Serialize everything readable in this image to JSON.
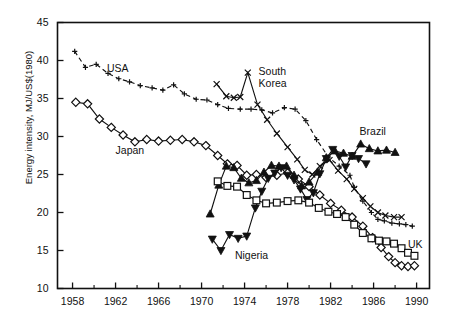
{
  "chart_data": {
    "type": "line",
    "title": "",
    "xlabel": "",
    "ylabel": "Energy intensity, MJ/US$(1980)",
    "xlim": [
      1956.6,
      1991.2
    ],
    "ylim": [
      10,
      45
    ],
    "xticks": [
      1958,
      1962,
      1966,
      1970,
      1974,
      1978,
      1982,
      1986,
      1990
    ],
    "yticks": [
      10,
      15,
      20,
      25,
      30,
      35,
      40,
      45
    ],
    "xtick_labels": [
      "1958",
      "1962",
      "1966",
      "1970",
      "1974",
      "1978",
      "1982",
      "1986",
      "1990"
    ],
    "ytick_labels": [
      "10",
      "15",
      "20",
      "25",
      "30",
      "35",
      "40",
      "45"
    ],
    "xtick_minor_step": 2,
    "grid": false,
    "legend": "inline-annotations",
    "series": [
      {
        "name": "USA",
        "marker": "plus",
        "line": "dashed",
        "color": "#111111",
        "points": [
          [
            1958.2,
            41.2
          ],
          [
            1959.2,
            39.1
          ],
          [
            1960.2,
            39.5
          ],
          [
            1961.3,
            38.3
          ],
          [
            1962.3,
            37.6
          ],
          [
            1963.3,
            37.2
          ],
          [
            1964.3,
            36.7
          ],
          [
            1965.4,
            36.4
          ],
          [
            1966.4,
            36.1
          ],
          [
            1967.4,
            36.8
          ],
          [
            1968.4,
            35.6
          ],
          [
            1969.5,
            34.9
          ],
          [
            1970.5,
            34.8
          ],
          [
            1971.5,
            34.2
          ],
          [
            1972.5,
            33.7
          ],
          [
            1973.6,
            33.6
          ],
          [
            1974.6,
            33.6
          ],
          [
            1975.6,
            33.5
          ],
          [
            1976.6,
            33.1
          ],
          [
            1977.7,
            33.8
          ],
          [
            1978.7,
            33.6
          ],
          [
            1979.7,
            32.1
          ],
          [
            1980.7,
            29.6
          ],
          [
            1981.8,
            27.3
          ],
          [
            1982.8,
            26.1
          ],
          [
            1983.8,
            24.9
          ],
          [
            1984.2,
            23.3
          ],
          [
            1985.0,
            21.5
          ],
          [
            1985.8,
            20.0
          ],
          [
            1986.4,
            19.1
          ],
          [
            1987.0,
            18.9
          ],
          [
            1987.7,
            18.6
          ],
          [
            1988.4,
            18.5
          ],
          [
            1989.0,
            18.4
          ],
          [
            1989.6,
            18.2
          ]
        ]
      },
      {
        "name": "Japan",
        "marker": "diamond-open",
        "line": "solid",
        "color": "#111111",
        "points": [
          [
            1958.3,
            34.5
          ],
          [
            1959.4,
            34.3
          ],
          [
            1960.5,
            32.3
          ],
          [
            1961.6,
            31.2
          ],
          [
            1962.7,
            30.2
          ],
          [
            1963.8,
            29.3
          ],
          [
            1964.9,
            29.6
          ],
          [
            1966.0,
            29.4
          ],
          [
            1967.1,
            29.5
          ],
          [
            1968.2,
            29.6
          ],
          [
            1969.3,
            29.3
          ],
          [
            1970.4,
            28.8
          ],
          [
            1971.5,
            27.5
          ],
          [
            1972.4,
            26.4
          ],
          [
            1973.3,
            26.2
          ],
          [
            1974.2,
            24.9
          ],
          [
            1975.1,
            25.0
          ],
          [
            1976.0,
            24.6
          ],
          [
            1977.0,
            24.9
          ],
          [
            1978.0,
            25.2
          ],
          [
            1979.0,
            24.4
          ],
          [
            1980.0,
            23.4
          ],
          [
            1981.0,
            22.3
          ],
          [
            1982.0,
            21.2
          ],
          [
            1983.0,
            20.3
          ],
          [
            1984.0,
            19.4
          ],
          [
            1985.0,
            18.2
          ],
          [
            1985.9,
            16.7
          ],
          [
            1986.7,
            15.4
          ],
          [
            1987.4,
            14.2
          ],
          [
            1988.0,
            13.4
          ],
          [
            1988.6,
            13.0
          ],
          [
            1989.2,
            12.9
          ],
          [
            1989.8,
            13.0
          ]
        ]
      },
      {
        "name": "South Korea",
        "marker": "cross",
        "line": "solid",
        "color": "#111111",
        "points": [
          [
            1971.4,
            36.9
          ],
          [
            1972.3,
            35.3
          ],
          [
            1973.0,
            35.1
          ],
          [
            1973.6,
            35.2
          ],
          [
            1974.3,
            38.4
          ],
          [
            1975.2,
            34.2
          ],
          [
            1976.1,
            32.2
          ],
          [
            1977.0,
            30.4
          ],
          [
            1978.0,
            28.6
          ],
          [
            1978.9,
            27.0
          ],
          [
            1979.6,
            25.6
          ],
          [
            1980.3,
            25.0
          ],
          [
            1981.0,
            26.1
          ],
          [
            1981.9,
            26.9
          ],
          [
            1982.7,
            25.5
          ],
          [
            1983.5,
            24.4
          ],
          [
            1984.2,
            23.1
          ],
          [
            1985.0,
            21.9
          ],
          [
            1985.7,
            20.8
          ],
          [
            1986.4,
            20.0
          ],
          [
            1987.1,
            19.6
          ],
          [
            1987.9,
            19.4
          ],
          [
            1988.6,
            19.4
          ]
        ]
      },
      {
        "name": "Brazil",
        "marker": "triangle-up",
        "line": "solid",
        "color": "#111111",
        "points": [
          [
            1970.8,
            19.8
          ],
          [
            1971.6,
            23.6
          ],
          [
            1972.3,
            26.1
          ],
          [
            1973.0,
            25.9
          ],
          [
            1973.7,
            24.5
          ],
          [
            1974.4,
            23.9
          ],
          [
            1975.1,
            24.2
          ],
          [
            1975.8,
            25.3
          ],
          [
            1976.5,
            26.2
          ],
          [
            1977.2,
            26.1
          ],
          [
            1977.9,
            26.1
          ],
          [
            1978.6,
            24.9
          ],
          [
            1979.3,
            23.5
          ],
          [
            1980.0,
            24.0
          ],
          [
            1980.8,
            25.3
          ],
          [
            1981.6,
            27.2
          ],
          [
            1982.4,
            28.1
          ],
          [
            1983.2,
            27.8
          ],
          [
            1984.0,
            27.4
          ],
          [
            1984.8,
            29.0
          ],
          [
            1985.6,
            28.4
          ],
          [
            1986.4,
            28.1
          ],
          [
            1987.2,
            28.2
          ],
          [
            1988.0,
            27.9
          ]
        ]
      },
      {
        "name": "Nigeria",
        "marker": "triangle-down",
        "line": "solid",
        "color": "#111111",
        "points": [
          [
            1971.0,
            16.5
          ],
          [
            1971.8,
            15.0
          ],
          [
            1972.6,
            17.1
          ],
          [
            1973.4,
            16.6
          ],
          [
            1974.2,
            16.9
          ],
          [
            1975.0,
            20.6
          ],
          [
            1975.6,
            22.8
          ],
          [
            1976.2,
            24.5
          ],
          [
            1976.8,
            25.2
          ],
          [
            1977.4,
            25.9
          ],
          [
            1978.0,
            24.9
          ],
          [
            1978.6,
            24.3
          ],
          [
            1979.2,
            23.1
          ],
          [
            1979.8,
            21.7
          ],
          [
            1980.4,
            22.6
          ],
          [
            1981.0,
            25.1
          ],
          [
            1981.6,
            27.1
          ],
          [
            1982.2,
            28.3
          ],
          [
            1982.8,
            27.4
          ],
          [
            1983.4,
            26.0
          ],
          [
            1984.0,
            27.5
          ],
          [
            1984.6,
            27.1
          ],
          [
            1985.3,
            26.4
          ]
        ]
      },
      {
        "name": "UK",
        "marker": "square-open",
        "line": "solid",
        "color": "#111111",
        "points": [
          [
            1971.5,
            24.1
          ],
          [
            1972.4,
            23.5
          ],
          [
            1973.3,
            23.4
          ],
          [
            1974.2,
            22.3
          ],
          [
            1975.1,
            21.6
          ],
          [
            1976.0,
            21.2
          ],
          [
            1977.0,
            21.3
          ],
          [
            1978.0,
            21.5
          ],
          [
            1979.0,
            21.6
          ],
          [
            1980.0,
            21.3
          ],
          [
            1980.9,
            20.6
          ],
          [
            1981.8,
            20.1
          ],
          [
            1982.6,
            19.8
          ],
          [
            1983.4,
            19.4
          ],
          [
            1984.2,
            18.4
          ],
          [
            1985.0,
            17.3
          ],
          [
            1985.8,
            16.6
          ],
          [
            1986.5,
            16.3
          ],
          [
            1987.2,
            16.2
          ],
          [
            1987.9,
            15.9
          ],
          [
            1988.6,
            15.3
          ],
          [
            1989.2,
            14.7
          ],
          [
            1989.8,
            14.3
          ]
        ]
      }
    ],
    "annotations": [
      {
        "text": "USA",
        "x": 1961.2,
        "y": 38.7
      },
      {
        "text": "Japan",
        "x": 1962.0,
        "y": 28.0
      },
      {
        "text": "South\nKorea",
        "x": 1975.3,
        "y": 38.3
      },
      {
        "text": "Brazil",
        "x": 1984.7,
        "y": 30.4
      },
      {
        "text": "Nigeria",
        "x": 1973.1,
        "y": 14.2
      },
      {
        "text": "UK",
        "x": 1989.2,
        "y": 15.6
      }
    ]
  }
}
